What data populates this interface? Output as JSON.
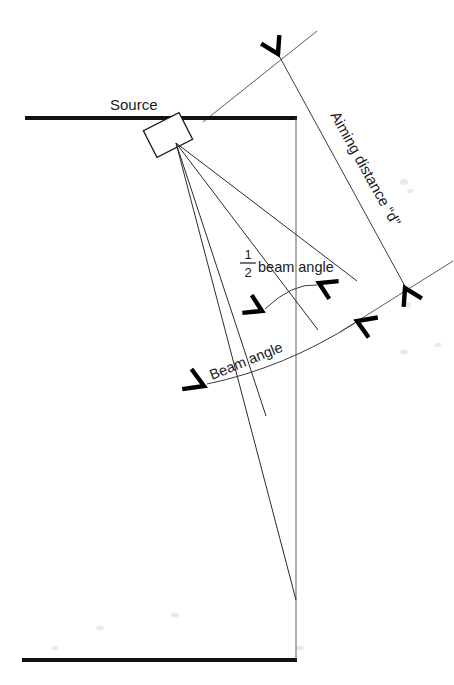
{
  "figure": {
    "background_color": "#ffffff",
    "ink_color": "#1a1a1a",
    "width": 454,
    "height": 685
  },
  "labels": {
    "source": "Source",
    "aiming_distance": "Aiming distance “d”",
    "half_beam_angle_fraction_numerator": "1",
    "half_beam_angle_fraction_denominator": "2",
    "half_beam_angle_text": "beam angle",
    "beam_angle": "Beam angle"
  },
  "geometry": {
    "top_rule": {
      "x1": 25,
      "y1": 118,
      "x2": 296,
      "y2": 118
    },
    "bottom_rule": {
      "x1": 22,
      "y1": 660,
      "x2": 296,
      "y2": 660
    },
    "vertical_axis": {
      "x1": 296,
      "y1": 118,
      "x2": 296,
      "y2": 660
    },
    "source_box": {
      "center_x": 168,
      "center_y": 135,
      "width": 40,
      "height": 30,
      "rotation_deg": -27
    },
    "ray_origin": {
      "x": 176,
      "y": 143
    },
    "rays": [
      {
        "name": "ray-outer-left",
        "x2": 296,
        "y2": 600
      },
      {
        "name": "ray-mid-left",
        "x2": 266,
        "y2": 415
      },
      {
        "name": "ray-mid-right",
        "x2": 318,
        "y2": 330
      },
      {
        "name": "ray-axis-upper",
        "x2": 356,
        "y2": 280
      }
    ],
    "aiming_dimension": {
      "from": {
        "x": 277,
        "y": 52
      },
      "to": {
        "x": 406,
        "y": 288
      },
      "extension_upper": {
        "x1": 203,
        "y1": 122,
        "x2": 316,
        "y2": 32
      },
      "extension_lower": {
        "x1": 350,
        "y1": 325,
        "x2": 452,
        "y2": 262
      },
      "label_rotation_deg": 61
    },
    "half_beam_arc": {
      "start": {
        "x": 263,
        "y": 310
      },
      "end": {
        "x": 318,
        "y": 284
      },
      "label_x": 252,
      "label_y": 272
    },
    "beam_arc": {
      "start": {
        "x": 205,
        "y": 384
      },
      "end": {
        "x": 356,
        "y": 322
      },
      "label_rotation_deg": -22
    }
  },
  "annotations": {
    "arrowheads": [
      {
        "name": "arrow-aiming-upper",
        "x": 278,
        "y": 54,
        "angle_deg": -118
      },
      {
        "name": "arrow-aiming-lower",
        "x": 405,
        "y": 287,
        "angle_deg": 62
      },
      {
        "name": "arrow-half-beam-left",
        "x": 263,
        "y": 310,
        "angle_deg": 205
      },
      {
        "name": "arrow-half-beam-right",
        "x": 318,
        "y": 284,
        "angle_deg": 25
      },
      {
        "name": "arrow-beam-left",
        "x": 205,
        "y": 385,
        "angle_deg": 202
      },
      {
        "name": "arrow-beam-right",
        "x": 356,
        "y": 322,
        "angle_deg": 22
      }
    ]
  }
}
